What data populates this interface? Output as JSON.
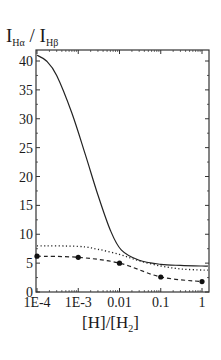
{
  "chart_data": {
    "type": "line",
    "title": "",
    "ylabel": {
      "main": "I",
      "sub1": "Hα",
      "sep": " / ",
      "main2": "I",
      "sub2": "Hβ"
    },
    "xlabel": {
      "pre": "[H]/[H",
      "sub": "2",
      "post": "]"
    },
    "xscale": "log",
    "xlim": [
      0.0001,
      1.5
    ],
    "ylim": [
      0,
      42
    ],
    "x_ticks": [
      {
        "value": 0.0001,
        "label": "1E-4"
      },
      {
        "value": 0.001,
        "label": "1E-3"
      },
      {
        "value": 0.01,
        "label": "0.01"
      },
      {
        "value": 0.1,
        "label": "0.1"
      },
      {
        "value": 1,
        "label": "1"
      }
    ],
    "y_ticks": [
      0,
      5,
      10,
      15,
      20,
      25,
      30,
      35,
      40
    ],
    "grid": false,
    "legend": null,
    "series": [
      {
        "name": "solid",
        "style": "solid",
        "x": [
          0.0001,
          0.00017,
          0.0003,
          0.0007,
          0.0015,
          0.003,
          0.006,
          0.011,
          0.03,
          0.1,
          0.3,
          1,
          1.5
        ],
        "y": [
          41.0,
          40.0,
          37.5,
          31.0,
          23.7,
          16.8,
          10.7,
          7.3,
          5.5,
          4.8,
          4.6,
          4.5,
          4.5
        ]
      },
      {
        "name": "dotted",
        "style": "dotted",
        "x": [
          0.0001,
          0.001,
          0.003,
          0.01,
          0.03,
          0.1,
          0.3,
          1,
          1.5
        ],
        "y": [
          8.0,
          7.9,
          7.4,
          6.5,
          5.4,
          4.5,
          4.0,
          3.8,
          3.8
        ]
      },
      {
        "name": "dashed-markers",
        "style": "dashed",
        "markers": true,
        "x": [
          0.0001,
          0.001,
          0.01,
          0.1,
          1
        ],
        "y": [
          6.2,
          6.0,
          5.0,
          2.6,
          1.8
        ]
      }
    ]
  }
}
